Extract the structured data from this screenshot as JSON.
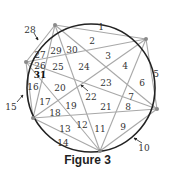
{
  "caption": "Figure 3",
  "colors": {
    "circle": "#222222",
    "chord": "#a8a8a8",
    "vertex": "#8a8a8a",
    "label": "#333333",
    "arrow": "#222222"
  },
  "circle": {
    "cx": 91,
    "cy": 88,
    "r": 64
  },
  "vertices": [
    {
      "id": "A",
      "x": 55,
      "y": 25
    },
    {
      "id": "B",
      "x": 146,
      "y": 39
    },
    {
      "id": "C",
      "x": 157,
      "y": 109
    },
    {
      "id": "D",
      "x": 100,
      "y": 151
    },
    {
      "id": "E",
      "x": 33,
      "y": 118
    },
    {
      "id": "F",
      "x": 26,
      "y": 62
    }
  ],
  "chords": [
    [
      "A",
      "B"
    ],
    [
      "A",
      "C"
    ],
    [
      "A",
      "D"
    ],
    [
      "A",
      "E"
    ],
    [
      "A",
      "F"
    ],
    [
      "B",
      "C"
    ],
    [
      "B",
      "D"
    ],
    [
      "B",
      "E"
    ],
    [
      "B",
      "F"
    ],
    [
      "C",
      "D"
    ],
    [
      "C",
      "E"
    ],
    [
      "C",
      "F"
    ],
    [
      "D",
      "E"
    ],
    [
      "D",
      "F"
    ],
    [
      "E",
      "F"
    ]
  ],
  "region_labels": [
    {
      "n": "1",
      "x": 101,
      "y": 27
    },
    {
      "n": "2",
      "x": 92,
      "y": 41
    },
    {
      "n": "3",
      "x": 108,
      "y": 56
    },
    {
      "n": "4",
      "x": 125,
      "y": 66
    },
    {
      "n": "5",
      "x": 156,
      "y": 74
    },
    {
      "n": "6",
      "x": 142,
      "y": 83
    },
    {
      "n": "7",
      "x": 131,
      "y": 97
    },
    {
      "n": "8",
      "x": 128,
      "y": 107
    },
    {
      "n": "9",
      "x": 123,
      "y": 127
    },
    {
      "n": "10",
      "x": 144,
      "y": 148
    },
    {
      "n": "11",
      "x": 100,
      "y": 129
    },
    {
      "n": "12",
      "x": 82,
      "y": 125
    },
    {
      "n": "13",
      "x": 65,
      "y": 129
    },
    {
      "n": "14",
      "x": 63,
      "y": 143
    },
    {
      "n": "15",
      "x": 11,
      "y": 107
    },
    {
      "n": "16",
      "x": 33,
      "y": 87
    },
    {
      "n": "17",
      "x": 45,
      "y": 102
    },
    {
      "n": "18",
      "x": 55,
      "y": 113
    },
    {
      "n": "19",
      "x": 71,
      "y": 106
    },
    {
      "n": "20",
      "x": 60,
      "y": 88
    },
    {
      "n": "21",
      "x": 106,
      "y": 107
    },
    {
      "n": "22",
      "x": 91,
      "y": 97
    },
    {
      "n": "23",
      "x": 106,
      "y": 83
    },
    {
      "n": "24",
      "x": 84,
      "y": 67
    },
    {
      "n": "25",
      "x": 58,
      "y": 67
    },
    {
      "n": "26",
      "x": 40,
      "y": 66
    },
    {
      "n": "27",
      "x": 40,
      "y": 55
    },
    {
      "n": "28",
      "x": 30,
      "y": 30
    },
    {
      "n": "29",
      "x": 56,
      "y": 51
    },
    {
      "n": "30",
      "x": 72,
      "y": 50
    },
    {
      "n": "31",
      "x": 40,
      "y": 75,
      "bold": true
    }
  ],
  "arrows": [
    {
      "target": "28",
      "x1": 34,
      "y1": 33,
      "x2": 38,
      "y2": 40
    },
    {
      "target": "15",
      "x1": 17,
      "y1": 102,
      "x2": 23,
      "y2": 95
    },
    {
      "target": "22",
      "x1": 88,
      "y1": 91,
      "x2": 81,
      "y2": 85
    },
    {
      "target": "10",
      "x1": 142,
      "y1": 143,
      "x2": 134,
      "y2": 138
    }
  ]
}
